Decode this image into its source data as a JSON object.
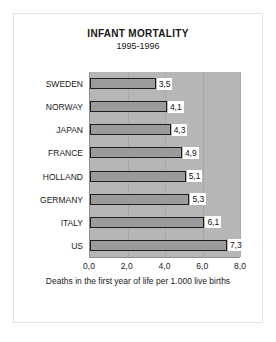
{
  "chart_data": {
    "type": "bar",
    "orientation": "horizontal",
    "title": "INFANT MORTALITY",
    "subtitle": "1995-1996",
    "caption": "Deaths in the first year of life per 1.000 live births",
    "categories": [
      "SWEDEN",
      "NORWAY",
      "JAPAN",
      "FRANCE",
      "HOLLAND",
      "GERMANY",
      "ITALY",
      "US"
    ],
    "values": [
      3.5,
      4.1,
      4.3,
      4.9,
      5.1,
      5.3,
      6.1,
      7.3
    ],
    "value_labels": [
      "3,5",
      "4,1",
      "4,3",
      "4,9",
      "5,1",
      "5,3",
      "6,1",
      "7,3"
    ],
    "xlabel": "",
    "ylabel": "",
    "xlim": [
      0.0,
      8.0
    ],
    "xticks": [
      0.0,
      2.0,
      4.0,
      6.0,
      8.0
    ],
    "xtick_labels": [
      "0,0",
      "2,0",
      "4,0",
      "6,0",
      "8,0"
    ],
    "grid": true,
    "legend": null,
    "decimal_separator": ",",
    "colors": {
      "bar_fill": "#9b9b9b",
      "bar_border": "#1e1e1e",
      "plot_background": "#b6b6b6",
      "gridline": "#a9a9a9",
      "axis_line": "#8d8d8d",
      "figure_background": "#ffffff",
      "text": "#1a1a1a",
      "value_label_background": "#ffffff"
    }
  }
}
